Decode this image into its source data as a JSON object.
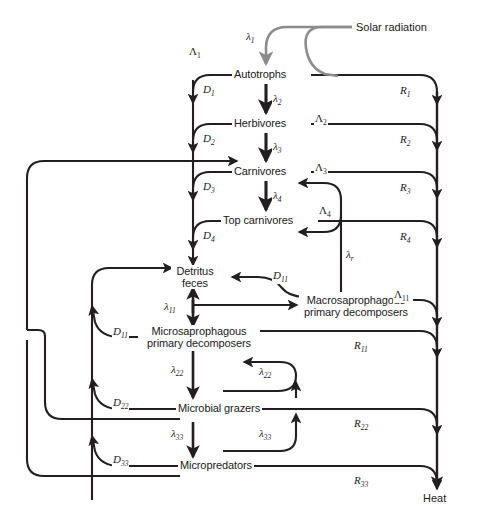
{
  "figure": {
    "background": "#ffffff",
    "line_color": "#231f20",
    "solar_color": "#8c8c8c",
    "text_color": "#1a1a1a"
  },
  "sources": {
    "solar": "Solar radiation",
    "sink": "Heat"
  },
  "nodes": [
    {
      "id": "autotrophs",
      "label": "Autotrophs",
      "line2": ""
    },
    {
      "id": "herbivores",
      "label": "Herbivores",
      "line2": ""
    },
    {
      "id": "carnivores",
      "label": "Carnivores",
      "line2": ""
    },
    {
      "id": "topcarn",
      "label": "Top carnivores",
      "line2": ""
    },
    {
      "id": "detritus",
      "label": "Detritus",
      "line2": "feces"
    },
    {
      "id": "macrosap",
      "label": "Macrosaprophagous",
      "line2": "primary decomposers"
    },
    {
      "id": "microsap",
      "label": "Microsaprophagous",
      "line2": "primary decomposers"
    },
    {
      "id": "grazers",
      "label": "Microbial grazers",
      "line2": ""
    },
    {
      "id": "micropred",
      "label": "Micropredators",
      "line2": ""
    }
  ],
  "flows": {
    "lambda": [
      {
        "id": "l1",
        "base": "λ",
        "sub": "1"
      },
      {
        "id": "l2",
        "base": "λ",
        "sub": "2"
      },
      {
        "id": "l3",
        "base": "λ",
        "sub": "3"
      },
      {
        "id": "l4",
        "base": "λ",
        "sub": "4"
      },
      {
        "id": "lr",
        "base": "λ",
        "sub": "r"
      },
      {
        "id": "l11",
        "base": "λ",
        "sub": "11"
      },
      {
        "id": "l22a",
        "base": "λ",
        "sub": "22"
      },
      {
        "id": "l22b",
        "base": "λ",
        "sub": "22"
      },
      {
        "id": "l33a",
        "base": "λ",
        "sub": "33"
      },
      {
        "id": "l33b",
        "base": "λ",
        "sub": "33"
      }
    ],
    "Lambda": [
      {
        "id": "L1",
        "base": "Λ",
        "sub": "1"
      },
      {
        "id": "L2",
        "base": "Λ",
        "sub": "2"
      },
      {
        "id": "L3",
        "base": "Λ",
        "sub": "3"
      },
      {
        "id": "L4",
        "base": "Λ",
        "sub": "4"
      },
      {
        "id": "L11",
        "base": "Λ",
        "sub": "11"
      }
    ],
    "D": [
      {
        "id": "D1",
        "base": "D",
        "sub": "1"
      },
      {
        "id": "D2",
        "base": "D",
        "sub": "2"
      },
      {
        "id": "D3",
        "base": "D",
        "sub": "3"
      },
      {
        "id": "D4",
        "base": "D",
        "sub": "4"
      },
      {
        "id": "D11a",
        "base": "D",
        "sub": "11"
      },
      {
        "id": "D11b",
        "base": "D",
        "sub": "11"
      },
      {
        "id": "D22",
        "base": "D",
        "sub": "22"
      },
      {
        "id": "D33",
        "base": "D",
        "sub": "33"
      }
    ],
    "R": [
      {
        "id": "R1",
        "base": "R",
        "sub": "1"
      },
      {
        "id": "R2",
        "base": "R",
        "sub": "2"
      },
      {
        "id": "R3",
        "base": "R",
        "sub": "3"
      },
      {
        "id": "R4",
        "base": "R",
        "sub": "4"
      },
      {
        "id": "R11",
        "base": "R",
        "sub": "11"
      },
      {
        "id": "R22",
        "base": "R",
        "sub": "22"
      },
      {
        "id": "R33",
        "base": "R",
        "sub": "33"
      }
    ]
  }
}
